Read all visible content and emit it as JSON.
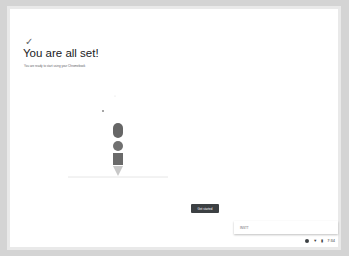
{
  "page": {
    "check_icon": "✓",
    "title": "You are all set!",
    "subtitle": "You are ready to start using your Chromebook"
  },
  "actions": {
    "get_started": "Get started"
  },
  "toast": {
    "text": "INSTT"
  },
  "tray": {
    "time": "7:34"
  }
}
